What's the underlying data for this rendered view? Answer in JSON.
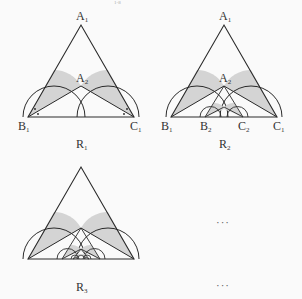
{
  "header_fragment": "1-8",
  "figures": [
    {
      "caption": "R",
      "caption_sub": "1",
      "points": {
        "A1": {
          "name": "A",
          "sub": "1"
        },
        "A2": {
          "name": "A",
          "sub": "2"
        },
        "B1": {
          "name": "B",
          "sub": "1"
        },
        "C1": {
          "name": "C",
          "sub": "1"
        }
      }
    },
    {
      "caption": "R",
      "caption_sub": "2",
      "points": {
        "A1": {
          "name": "A",
          "sub": "1"
        },
        "A2": {
          "name": "A",
          "sub": "2"
        },
        "B1": {
          "name": "B",
          "sub": "1"
        },
        "C1": {
          "name": "C",
          "sub": "1"
        },
        "B2": {
          "name": "B",
          "sub": "2"
        },
        "C2": {
          "name": "C",
          "sub": "2"
        }
      }
    },
    {
      "caption": "R",
      "caption_sub": "3"
    }
  ],
  "ellipsis_top": "···",
  "ellipsis_bottom": "···",
  "colors": {
    "line": "#2a2a2a",
    "shade": "#d4d4d4",
    "background": "#fafafa"
  }
}
